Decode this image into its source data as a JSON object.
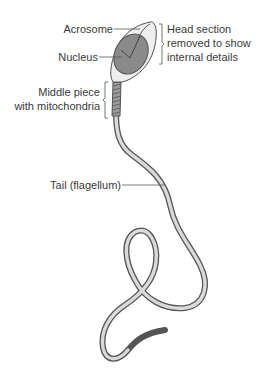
{
  "diagram": {
    "labels": {
      "acrosome": "Acrosome",
      "nucleus": "Nucleus",
      "head_note_line1": "Head section",
      "head_note_line2": "removed to show",
      "head_note_line3": "internal details",
      "middle_piece_line1": "Middle piece",
      "middle_piece_line2": "with mitochondria",
      "tail": "Tail (flagellum)"
    },
    "colors": {
      "nucleus_fill": "#8a8a8a",
      "outline": "#555555",
      "body_fill": "#d9d9d9",
      "label_text": "#3a3a3a"
    }
  }
}
